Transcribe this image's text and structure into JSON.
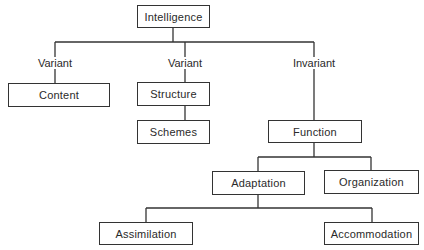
{
  "diagram": {
    "type": "tree",
    "root": {
      "label": "Intelligence"
    },
    "branch_labels": {
      "content": "Variant",
      "structure": "Variant",
      "function": "Invariant"
    },
    "nodes": {
      "intelligence": "Intelligence",
      "content": "Content",
      "structure": "Structure",
      "schemes": "Schemes",
      "function": "Function",
      "adaptation": "Adaptation",
      "organization": "Organization",
      "assimilation": "Assimilation",
      "accommodation": "Accommodation"
    },
    "edges": [
      {
        "from": "Intelligence",
        "to": "Content",
        "label": "Variant"
      },
      {
        "from": "Intelligence",
        "to": "Structure",
        "label": "Variant"
      },
      {
        "from": "Intelligence",
        "to": "Function",
        "label": "Invariant"
      },
      {
        "from": "Structure",
        "to": "Schemes"
      },
      {
        "from": "Function",
        "to": "Adaptation"
      },
      {
        "from": "Function",
        "to": "Organization"
      },
      {
        "from": "Adaptation",
        "to": "Assimilation"
      },
      {
        "from": "Adaptation",
        "to": "Accommodation"
      }
    ],
    "colors": {
      "line": "#333333",
      "text": "#2a2a2a",
      "background": "#ffffff"
    }
  }
}
